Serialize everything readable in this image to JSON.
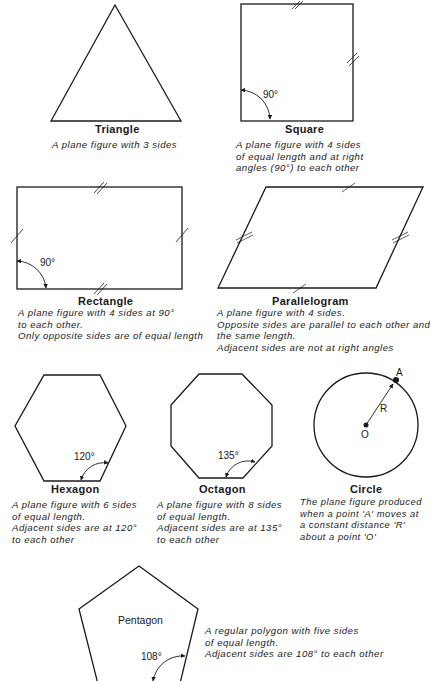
{
  "figures": {
    "triangle": {
      "title": "Triangle",
      "lines": [
        "A plane figure with 3 sides"
      ]
    },
    "square": {
      "title": "Square",
      "angle": "90°",
      "lines": [
        "A plane figure with 4 sides",
        "of equal length and at right",
        "angles (90°) to each other"
      ]
    },
    "rectangle": {
      "title": "Rectangle",
      "angle": "90°",
      "lines": [
        "A plane figure with 4 sides at 90°",
        "to each other.",
        "Only opposite sides are of equal length"
      ]
    },
    "parallelogram": {
      "title": "Parallelogram",
      "lines": [
        "A plane figure with 4 sides.",
        "Opposite sides are parallel to each other and",
        "the same length.",
        "Adjacent sides are not at right angles"
      ]
    },
    "hexagon": {
      "title": "Hexagon",
      "angle": "120°",
      "lines": [
        "A plane figure with 6 sides",
        "of equal length.",
        "Adjacent sides are at 120°",
        "to each other"
      ]
    },
    "octagon": {
      "title": "Octagon",
      "angle": "135°",
      "lines": [
        "A plane figure with 8 sides",
        "of equal length.",
        "Adjacent sides are at 135°",
        "to each other"
      ]
    },
    "circle": {
      "title": "Circle",
      "point_a": "A",
      "radius": "R",
      "center": "O",
      "lines": [
        "The plane figure produced",
        "when a point 'A' moves at",
        "a constant distance 'R'",
        "about a point 'O'"
      ]
    },
    "pentagon": {
      "title": "Pentagon",
      "angle": "108°",
      "lines": [
        "A regular polygon with five sides",
        "of equal length.",
        "Adjacent sides are 108° to each other"
      ]
    }
  },
  "colors": {
    "ink": "#1a1a1a",
    "background": "#ffffff"
  }
}
